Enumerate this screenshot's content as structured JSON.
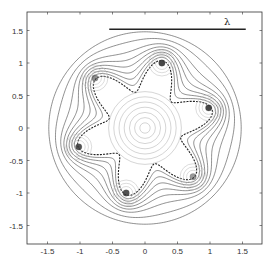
{
  "chart_data": {
    "type": "contour",
    "title": "",
    "xlabel": "",
    "ylabel": "",
    "xlim": [
      -1.8,
      1.8
    ],
    "ylim": [
      -1.8,
      1.8
    ],
    "xticks": [
      -1.5,
      -1,
      -0.5,
      0,
      0.5,
      1,
      1.5
    ],
    "yticks": [
      -1.5,
      -1,
      -0.5,
      0,
      0.5,
      1,
      1.5
    ],
    "xtick_labels": [
      "-1.5",
      "-1",
      "-0.5",
      "0",
      "0.5",
      "1",
      "1.5"
    ],
    "ytick_labels": [
      "-1.5",
      "-1",
      "-0.5",
      "0",
      "0.5",
      "1",
      "1.5"
    ],
    "grid": false,
    "scale_bar": {
      "label": "λ",
      "x_start": -0.55,
      "x_end": 1.55,
      "y": 1.52
    },
    "boundary": {
      "style": "dashed",
      "lobes": 6,
      "mean_radius": 0.82,
      "amplitude": 0.25,
      "phase_deg": 15
    },
    "outer_contours": [
      {
        "r": 0.9,
        "blend": 0.88
      },
      {
        "r": 0.97,
        "blend": 0.76
      },
      {
        "r": 1.04,
        "blend": 0.64
      },
      {
        "r": 1.11,
        "blend": 0.52
      },
      {
        "r": 1.18,
        "blend": 0.4
      },
      {
        "r": 1.26,
        "blend": 0.26
      },
      {
        "r": 1.37,
        "blend": 0.1
      },
      {
        "r": 1.48,
        "blend": 0.0
      }
    ],
    "inner_rings": {
      "center": [
        0,
        0
      ],
      "radii": [
        0.08,
        0.16,
        0.24,
        0.32,
        0.4,
        0.48,
        0.56
      ]
    },
    "hot_spots": [
      {
        "x": 0.98,
        "y": 0.31,
        "intensity": 0.9
      },
      {
        "x": 0.26,
        "y": 1.0,
        "intensity": 0.9
      },
      {
        "x": -0.77,
        "y": 0.77,
        "intensity": 0.55
      },
      {
        "x": -1.02,
        "y": -0.29,
        "intensity": 0.85
      },
      {
        "x": -0.29,
        "y": -1.0,
        "intensity": 0.85
      },
      {
        "x": 0.74,
        "y": -0.75,
        "intensity": 0.5
      }
    ],
    "spot_ring_radii": [
      0.05,
      0.1,
      0.15,
      0.2
    ]
  },
  "colors": {
    "axis": "#333333",
    "contour": "#444444",
    "boundary": "#222222",
    "inner": "#b8b8b8",
    "spot": "#333333",
    "scale_bar": "#222222"
  }
}
